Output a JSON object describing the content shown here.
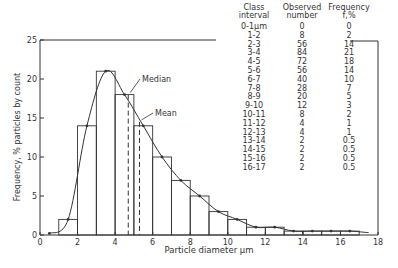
{
  "chart_data": {
    "type": "bar",
    "title": "",
    "xlabel": "Particle diameter μm",
    "ylabel": "Frequency, % particles by count",
    "xlim": [
      0,
      18
    ],
    "ylim": [
      0,
      25
    ],
    "x_ticks": [
      "0",
      "2",
      "4",
      "6",
      "8",
      "10",
      "12",
      "14",
      "16",
      "18"
    ],
    "y_ticks": [
      "0",
      "5",
      "10",
      "15",
      "20",
      "25"
    ],
    "grid": false,
    "categories": [
      "0-1",
      "1-2",
      "2-3",
      "3-4",
      "4-5",
      "5-6",
      "6-7",
      "7-8",
      "8-9",
      "9-10",
      "10-11",
      "11-12",
      "12-13",
      "13-14",
      "14-15",
      "15-16",
      "16-17"
    ],
    "series": [
      {
        "name": "Frequency f, %",
        "values": [
          0,
          2,
          14,
          21,
          18,
          14,
          10,
          7,
          5,
          3,
          2,
          1,
          1,
          0.5,
          0.5,
          0.5,
          0.5
        ]
      },
      {
        "name": "Observed number",
        "values": [
          0,
          8,
          56,
          84,
          72,
          56,
          40,
          28,
          20,
          12,
          8,
          4,
          4,
          2,
          2,
          2,
          2
        ]
      }
    ],
    "annotations": [
      {
        "label": "Median",
        "x": 4.7
      },
      {
        "label": "Mean",
        "x": 5.3
      }
    ],
    "curve": "smooth fitted distribution through bar midpoints"
  },
  "table": {
    "headers": {
      "class": [
        "Class",
        "interval"
      ],
      "observed": [
        "Observed",
        "number"
      ],
      "frequency": [
        "Frequency",
        "f,%"
      ]
    },
    "rows": [
      {
        "interval": "0-1μm",
        "observed": "0",
        "freq": "0"
      },
      {
        "interval": "1-2",
        "observed": "8",
        "freq": "2"
      },
      {
        "interval": "2-3",
        "observed": "56",
        "freq": "14"
      },
      {
        "interval": "3-4",
        "observed": "84",
        "freq": "21"
      },
      {
        "interval": "4-5",
        "observed": "72",
        "freq": "18"
      },
      {
        "interval": "5-6",
        "observed": "56",
        "freq": "14"
      },
      {
        "interval": "6-7",
        "observed": "40",
        "freq": "10"
      },
      {
        "interval": "7-8",
        "observed": "28",
        "freq": "7"
      },
      {
        "interval": "8-9",
        "observed": "20",
        "freq": "5"
      },
      {
        "interval": "9-10",
        "observed": "12",
        "freq": "3"
      },
      {
        "interval": "10-11",
        "observed": "8",
        "freq": "2"
      },
      {
        "interval": "11-12",
        "observed": "4",
        "freq": "1"
      },
      {
        "interval": "12-13",
        "observed": "4",
        "freq": "1"
      },
      {
        "interval": "13-14",
        "observed": "2",
        "freq": "0.5"
      },
      {
        "interval": "14-15",
        "observed": "2",
        "freq": "0.5"
      },
      {
        "interval": "15-16",
        "observed": "2",
        "freq": "0.5"
      },
      {
        "interval": "16-17",
        "observed": "2",
        "freq": "0.5"
      }
    ]
  },
  "colors": {
    "ink": "#333333",
    "background": "#ffffff"
  }
}
